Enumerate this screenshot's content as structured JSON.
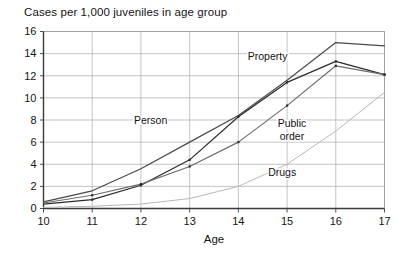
{
  "chart_data": {
    "type": "line",
    "title": "Cases per 1,000 juveniles in age group",
    "xlabel": "Age",
    "ylabel": "",
    "x": [
      10,
      11,
      12,
      13,
      14,
      15,
      16,
      17
    ],
    "xticklabels": [
      "10",
      "11",
      "12",
      "13",
      "14",
      "15",
      "16",
      "17"
    ],
    "yticklabels": [
      "0",
      "2",
      "4",
      "6",
      "8",
      "10",
      "12",
      "14",
      "16"
    ],
    "xlim": [
      10,
      17
    ],
    "ylim": [
      0,
      16
    ],
    "grid": true,
    "legend_position": "inline-labels",
    "series": [
      {
        "name": "Property",
        "color": "#4a4a4a",
        "values": [
          0.6,
          1.6,
          3.6,
          6.0,
          8.4,
          11.6,
          15.0,
          14.7
        ]
      },
      {
        "name": "Person",
        "color": "#2b2b2b",
        "values": [
          0.4,
          0.8,
          2.1,
          4.4,
          8.3,
          11.4,
          13.3,
          12.1
        ]
      },
      {
        "name": "Public order",
        "color": "#6e6e6e",
        "values": [
          0.5,
          1.2,
          2.2,
          3.8,
          6.0,
          9.3,
          12.9,
          12.1
        ]
      },
      {
        "name": "Drugs",
        "color": "#b8b8b8",
        "values": [
          0.1,
          0.2,
          0.4,
          0.9,
          2.0,
          4.0,
          7.0,
          10.5
        ]
      }
    ],
    "annotations": [
      {
        "label": "Property",
        "x": 14.6,
        "y": 13.4
      },
      {
        "label": "Person",
        "x": 12.2,
        "y": 7.6
      },
      {
        "label": "Public order",
        "x": 15.1,
        "y": 7.4
      },
      {
        "label": "Drugs",
        "x": 14.9,
        "y": 2.9
      }
    ]
  }
}
